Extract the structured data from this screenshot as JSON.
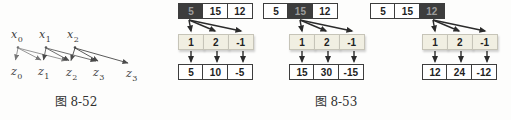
{
  "figure_8_52": {
    "caption": "图 8-52",
    "top_nodes": [
      {
        "base": "x",
        "sub": "0"
      },
      {
        "base": "x",
        "sub": "1"
      },
      {
        "base": "x",
        "sub": "2"
      }
    ],
    "bottom_nodes": [
      {
        "base": "z",
        "sub": "0"
      },
      {
        "base": "z",
        "sub": "1"
      },
      {
        "base": "z",
        "sub": "2"
      },
      {
        "base": "z",
        "sub": "3"
      },
      {
        "base": "z",
        "sub": "3"
      }
    ]
  },
  "figure_8_53": {
    "caption": "图 8-53",
    "input_sequence": [
      "5",
      "15",
      "12"
    ],
    "coefficients": [
      "1",
      "2",
      "-1"
    ],
    "blocks": [
      {
        "highlight_index": 0,
        "top": [
          "5",
          "15",
          "12"
        ],
        "mid": [
          "1",
          "2",
          "-1"
        ],
        "bottom": [
          "5",
          "10",
          "-5"
        ]
      },
      {
        "highlight_index": 1,
        "top": [
          "5",
          "15",
          "12"
        ],
        "mid": [
          "1",
          "2",
          "-1"
        ],
        "bottom": [
          "15",
          "30",
          "-15"
        ]
      },
      {
        "highlight_index": 2,
        "top": [
          "5",
          "15",
          "12"
        ],
        "mid": [
          "1",
          "2",
          "-1"
        ],
        "bottom": [
          "12",
          "24",
          "-12"
        ]
      }
    ]
  },
  "colors": {
    "highlight_cell": "#3d3d3d",
    "highlight_text": "#9c9c9c",
    "coeff_cell_bg": "#f1efe2",
    "cell_border": "#3d3d3d",
    "graph_arrow": "#777777",
    "block_arrow": "#2b2b2b"
  }
}
